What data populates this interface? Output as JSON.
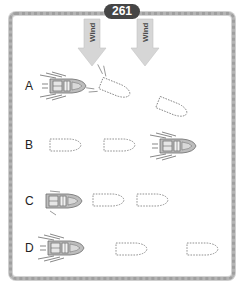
{
  "page": {
    "number_badge": "261"
  },
  "wind_arrows": [
    {
      "label": "Wind",
      "direction": "down"
    },
    {
      "label": "Wind",
      "direction": "down"
    }
  ],
  "rows": [
    {
      "label": "A",
      "description": "Boat heading right, followed by dashed outlines showing it turning down-right"
    },
    {
      "label": "B",
      "description": "Two dashed outlines ahead of stern, boat at far right heading right"
    },
    {
      "label": "C",
      "description": "Boat at left heading right followed by two dashed outlines"
    },
    {
      "label": "D",
      "description": "Boat at left heading right with wake, two dashed outlines spread far right"
    }
  ],
  "colors": {
    "badge_bg": "#454545",
    "badge_text": "#ffffff",
    "frame": "#b4b4b4",
    "arrow_fill": "#d6d6d6",
    "dashed_outline": "#777777",
    "boat_body": "#bdbdbd"
  }
}
